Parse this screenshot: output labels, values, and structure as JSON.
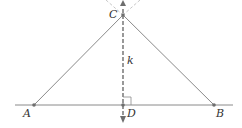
{
  "diagram": {
    "type": "geometry-construction",
    "points": {
      "A": {
        "label": "A"
      },
      "B": {
        "label": "B"
      },
      "C": {
        "label": "C"
      },
      "D": {
        "label": "D"
      }
    },
    "line_label": "k",
    "right_angle_at": "D",
    "colors": {
      "segment": "#8a8a8a",
      "dashed": "#6e6e6e",
      "construction": "#c8c8c8",
      "point": "#6e6e6e",
      "text": "#333333"
    }
  }
}
